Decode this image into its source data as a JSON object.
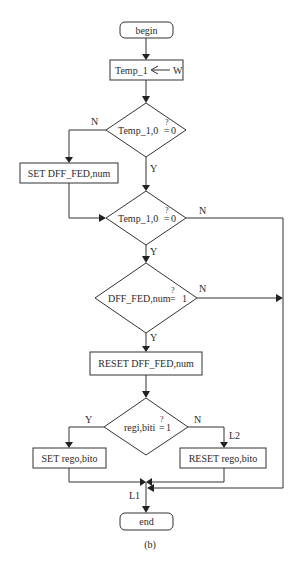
{
  "diagram": {
    "type": "flowchart",
    "caption": "(b)",
    "nodes": {
      "begin": "begin",
      "assign": {
        "left": "Temp_1",
        "arrow": "⟵",
        "right": "W"
      },
      "decision1": {
        "expr": "Temp_1,0",
        "op": "=",
        "q": "?",
        "value": "0"
      },
      "set_dff": "SET DFF_FED,num",
      "decision2": {
        "expr": "Temp_1,0",
        "op": "=",
        "q": "?",
        "value": "0"
      },
      "decision3": {
        "expr": "DFF_FED,num",
        "op": "=",
        "q": "?",
        "value": "1"
      },
      "reset_dff": "RESET DFF_FED,num",
      "decision4": {
        "expr": "regi,biti",
        "op": "=",
        "q": "?",
        "value": "1"
      },
      "set_rego": "SET rego,bito",
      "reset_rego": "RESET rego,bito",
      "end": "end"
    },
    "edge_labels": {
      "d1_no": "N",
      "d1_yes": "Y",
      "d2_no": "N",
      "d2_yes": "Y",
      "d3_no": "N",
      "d3_yes": "Y",
      "d4_yes": "Y",
      "d4_no": "N",
      "label_l2": "L2",
      "label_l1": "L1"
    }
  }
}
